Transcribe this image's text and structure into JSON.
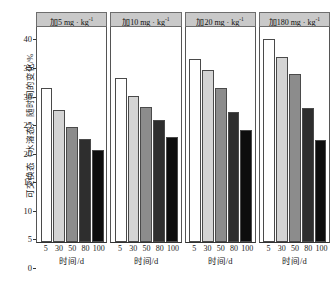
{
  "chart_data": {
    "type": "bar",
    "title": "",
    "xlabel": "时间/d",
    "ylabel": "可交换态（水溶态）随时间的变化/%",
    "ylim": [
      0,
      42
    ],
    "yticks": [
      0,
      5,
      10,
      15,
      20,
      25,
      30,
      35,
      40
    ],
    "categories": [
      "5",
      "30",
      "50",
      "80",
      "100"
    ],
    "grid": false,
    "legend": "none",
    "panel_layout": "1x4 faceted columns",
    "panels": [
      {
        "header": "加5 mg · kg",
        "header_exponent": "-1",
        "values": [
          30.0,
          25.7,
          22.4,
          20.2,
          17.9
        ],
        "xlabel": "时间/d"
      },
      {
        "header": "加10 mg · kg",
        "header_exponent": "-1",
        "values": [
          32.0,
          28.5,
          26.3,
          23.8,
          20.6
        ],
        "xlabel": "时间/d"
      },
      {
        "header": "加20 mg · kg",
        "header_exponent": "-1",
        "values": [
          35.8,
          33.6,
          30.1,
          25.4,
          21.8
        ],
        "xlabel": "时间/d"
      },
      {
        "header": "加180 mg · kg",
        "header_exponent": "-1",
        "values": [
          39.7,
          36.2,
          32.8,
          26.2,
          20.0
        ],
        "xlabel": "时间/d"
      }
    ],
    "bar_colors": [
      "#ffffff",
      "#d4d4d4",
      "#8c8c8c",
      "#2e2e2e",
      "#0d0d0d"
    ],
    "bar_edge_color": "#4a4a4a",
    "panel_header_bg": "#c9c9c9",
    "axis_color": "#333333"
  }
}
